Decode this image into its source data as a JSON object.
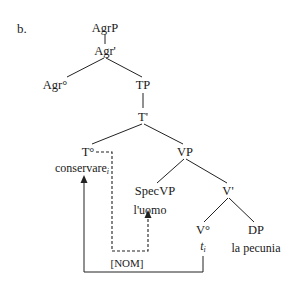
{
  "example_label": "b.",
  "tree": {
    "root": "AgrP",
    "agr_bar": "Agr'",
    "agr_head": "Agr°",
    "tp": "TP",
    "t_bar": "T'",
    "t_head": "T°",
    "t_head_word": "conservare",
    "t_head_index": "i",
    "vp": "VP",
    "spec_vp": "SpecVP",
    "spec_vp_word": "l'uomo",
    "v_bar": "V'",
    "v_head": "V°",
    "trace": "t",
    "trace_index": "i",
    "dp": "DP",
    "dp_word": "la pecunia"
  },
  "annotations": {
    "case_label": "[NOM]",
    "case_arrow_style": "dashed",
    "movement_arrow_style": "solid"
  }
}
